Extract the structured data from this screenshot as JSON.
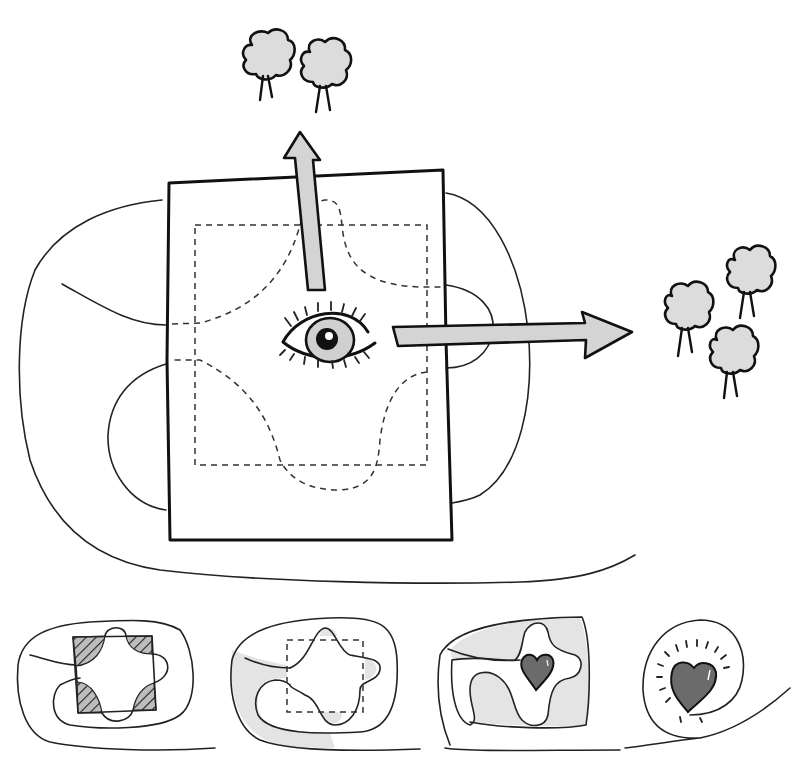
{
  "diagram": {
    "colors": {
      "background": "#ffffff",
      "ink": "#111111",
      "light_fill": "#dcdcdc",
      "heart_fill": "#6b6b6b"
    },
    "main_scene": {
      "frame": "rectangle-frame",
      "focus_icon": "eye-icon",
      "arrows": [
        {
          "direction": "up",
          "target": "tree-cluster-top",
          "tree_count": 2
        },
        {
          "direction": "right",
          "target": "tree-cluster-right",
          "tree_count": 3
        }
      ],
      "path": "winding-path",
      "inner_shape": "dashed-cross-and-square"
    },
    "stages": [
      {
        "index": 1,
        "motif": "hatched-corners"
      },
      {
        "index": 2,
        "motif": "shaded-path-with-dashed-square"
      },
      {
        "index": 3,
        "motif": "heart-in-cross"
      },
      {
        "index": 4,
        "motif": "radiant-heart-in-spiral"
      }
    ]
  }
}
